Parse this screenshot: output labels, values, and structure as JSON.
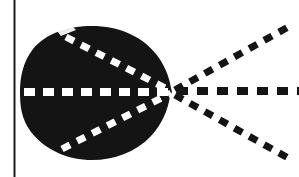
{
  "figure": {
    "type": "schematic-diagram",
    "width": 299,
    "height": 177,
    "background_color": "#ffffff",
    "ink_color": "#141414",
    "highlight_color": "#ffffff"
  },
  "border": {
    "name": "left-vertical-rule",
    "orientation": "vertical",
    "x": 14,
    "y_start": 0,
    "y_end": 177,
    "thickness": 2,
    "color": "#1a1a1a"
  },
  "lobe": {
    "name": "main-lobe",
    "description": "solid black cardioid-like blob with a cusp on the right",
    "fill_color": "#141414",
    "bounds": {
      "left": 20,
      "top": 26,
      "right": 172,
      "bottom": 160
    },
    "center": {
      "x": 92,
      "y": 92
    },
    "cusp_point": {
      "x": 172,
      "y": 92
    }
  },
  "focal_point": {
    "name": "convergence-point",
    "x": 172,
    "y": 92,
    "label": ""
  },
  "interior_rays": [
    {
      "name": "interior-ray-upper",
      "color": "#ffffff",
      "dash": "9 8",
      "thickness": 7,
      "from": {
        "x": 66,
        "y": 37
      },
      "to": {
        "x": 171,
        "y": 91
      },
      "angle_deg": -27
    },
    {
      "name": "interior-ray-axis",
      "color": "#ffffff",
      "dash": "11 8",
      "thickness": 8,
      "from": {
        "x": 24,
        "y": 92
      },
      "to": {
        "x": 171,
        "y": 92
      },
      "angle_deg": 0
    },
    {
      "name": "interior-ray-lower",
      "color": "#ffffff",
      "dash": "9 8",
      "thickness": 7,
      "from": {
        "x": 62,
        "y": 149
      },
      "to": {
        "x": 171,
        "y": 93
      },
      "angle_deg": 27
    }
  ],
  "exterior_rays": [
    {
      "name": "exterior-ray-upper",
      "color": "#141414",
      "dash": "9 8",
      "thickness": 7,
      "from": {
        "x": 175,
        "y": 90
      },
      "to": {
        "x": 290,
        "y": 26
      },
      "angle_deg": -29
    },
    {
      "name": "exterior-ray-axis",
      "color": "#141414",
      "dash": "11 9",
      "thickness": 8,
      "from": {
        "x": 177,
        "y": 91
      },
      "to": {
        "x": 299,
        "y": 91
      },
      "angle_deg": 0
    },
    {
      "name": "exterior-ray-lower",
      "color": "#141414",
      "dash": "9 8",
      "thickness": 7,
      "from": {
        "x": 175,
        "y": 95
      },
      "to": {
        "x": 290,
        "y": 159
      },
      "angle_deg": 29
    }
  ],
  "notches": [
    {
      "name": "notch-top",
      "x": 64,
      "y": 28
    },
    {
      "name": "notch-bottom",
      "x": 62,
      "y": 156
    }
  ]
}
